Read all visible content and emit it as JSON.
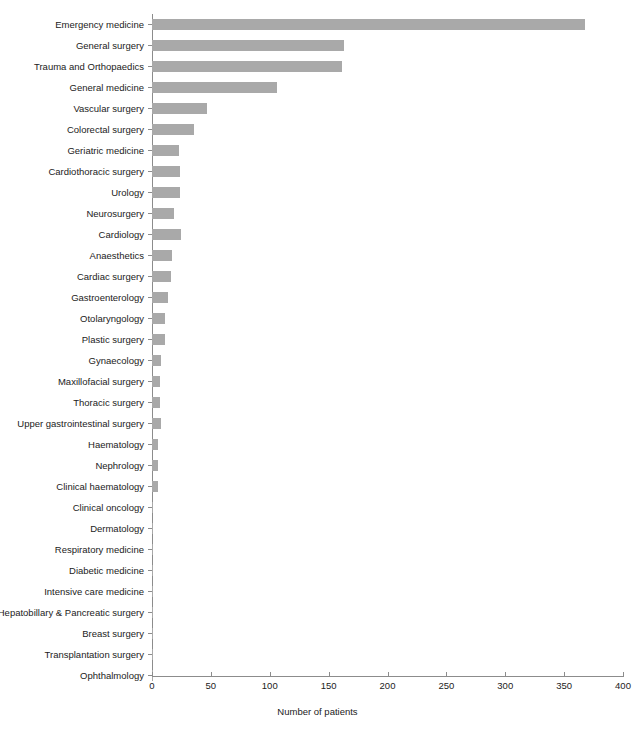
{
  "chart_data": {
    "type": "bar",
    "orientation": "horizontal",
    "title": "",
    "xlabel": "Number of patients",
    "ylabel": "",
    "xlim": [
      0,
      400
    ],
    "xticks": [
      0,
      50,
      100,
      150,
      200,
      250,
      300,
      350,
      400
    ],
    "grid": false,
    "legend": null,
    "bar_color": "#a9a9a9",
    "axis_color": "#8c8c8c",
    "categories": [
      "Emergency medicine",
      "General surgery",
      "Trauma and Orthopaedics",
      "General medicine",
      "Vascular surgery",
      "Colorectal surgery",
      "Geriatric medicine",
      "Cardiothoracic surgery",
      "Urology",
      "Neurosurgery",
      "Cardiology",
      "Anaesthetics",
      "Cardiac surgery",
      "Gastroenterology",
      "Otolaryngology",
      "Plastic surgery",
      "Gynaecology",
      "Maxillofacial surgery",
      "Thoracic surgery",
      "Upper gastrointestinal surgery",
      "Haematology",
      "Nephrology",
      "Clinical haematology",
      "Clinical oncology",
      "Dermatology",
      "Respiratory medicine",
      "Diabetic medicine",
      "Intensive care medicine",
      "Hepatobillary & Pancreatic surgery",
      "Breast surgery",
      "Transplantation surgery",
      "Ophthalmology"
    ],
    "values": [
      368,
      163,
      161,
      106,
      47,
      36,
      23,
      24,
      24,
      19,
      25,
      17,
      16,
      14,
      11,
      11,
      8,
      7,
      7,
      8,
      5,
      5,
      5,
      1,
      1,
      1,
      1,
      1,
      1,
      1,
      1,
      1
    ]
  }
}
